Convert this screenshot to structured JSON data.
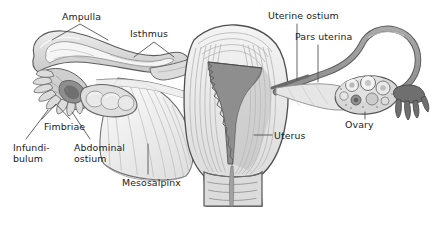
{
  "figure": {
    "frame_color": "#c9c9c9",
    "background_color": "#ffffff",
    "ink_color": "#1b1b1b",
    "leader_color": "#4a4a4a",
    "palette": {
      "outline_dark": "#4a4a4a",
      "outline_mid": "#6f6f6f",
      "tissue_lightest": "#f2f2f2",
      "tissue_light": "#e4e4e4",
      "tissue_mid": "#cfcfcf",
      "tissue_dark": "#a8a8a8",
      "cavity_dark": "#8a8a8a",
      "cavity_darkest": "#6b6b6b"
    }
  },
  "labels": [
    {
      "id": "ampulla",
      "text": "Ampulla",
      "lines": [
        "Ampulla"
      ],
      "x": 62,
      "y": 12,
      "leader": "inverted-v"
    },
    {
      "id": "isthmus",
      "text": "Isthmus",
      "lines": [
        "Isthmus"
      ],
      "x": 130,
      "y": 29,
      "leader": "inverted-v"
    },
    {
      "id": "uterine-ostium",
      "text": "Uterine ostium",
      "lines": [
        "Uterine ostium"
      ],
      "x": 268,
      "y": 11,
      "leader": "vertical"
    },
    {
      "id": "pars-uterina",
      "text": "Pars uterina",
      "lines": [
        "Pars uterina"
      ],
      "x": 295,
      "y": 32,
      "leader": "vertical"
    },
    {
      "id": "ovary",
      "text": "Ovary",
      "lines": [
        "Ovary"
      ],
      "x": 345,
      "y": 120,
      "leader": "vertical"
    },
    {
      "id": "uterus",
      "text": "Uterus",
      "lines": [
        "Uterus"
      ],
      "x": 274,
      "y": 131,
      "leader": "horizontal"
    },
    {
      "id": "fimbriae",
      "text": "Fimbriae",
      "lines": [
        "Fimbriae"
      ],
      "x": 44,
      "y": 122,
      "leader": "inverted-v"
    },
    {
      "id": "infundibulum",
      "text": "Infundibulum",
      "lines": [
        "Infundi-",
        "bulum"
      ],
      "x": 13,
      "y": 143,
      "leader": "diagonal"
    },
    {
      "id": "abdominal-ostium",
      "text": "Abdominal ostium",
      "lines": [
        "Abdominal",
        "ostium"
      ],
      "x": 74,
      "y": 143,
      "leader": "diagonal"
    },
    {
      "id": "mesosalpinx",
      "text": "Mesosalpinx",
      "lines": [
        "Mesosalpinx"
      ],
      "x": 122,
      "y": 178,
      "leader": "vertical"
    }
  ],
  "structures": [
    {
      "id": "left-ampulla",
      "name": "left-ampulla"
    },
    {
      "id": "left-isthmus",
      "name": "left-isthmus"
    },
    {
      "id": "left-infundibulum",
      "name": "left-infundibulum"
    },
    {
      "id": "left-fimbriae",
      "name": "left-fimbriae"
    },
    {
      "id": "left-ovary",
      "name": "left-ovary"
    },
    {
      "id": "mesosalpinx-fan",
      "name": "mesosalpinx-membrane"
    },
    {
      "id": "uterine-body",
      "name": "uterine-body"
    },
    {
      "id": "uterine-cavity",
      "name": "uterine-cavity"
    },
    {
      "id": "myometrium",
      "name": "myometrium"
    },
    {
      "id": "cervix",
      "name": "cervix"
    },
    {
      "id": "vagina",
      "name": "vaginal-canal"
    },
    {
      "id": "right-tube",
      "name": "right-uterine-tube"
    },
    {
      "id": "right-ovary",
      "name": "right-ovary-with-follicles"
    },
    {
      "id": "right-fimbriae",
      "name": "right-fimbriae"
    }
  ]
}
